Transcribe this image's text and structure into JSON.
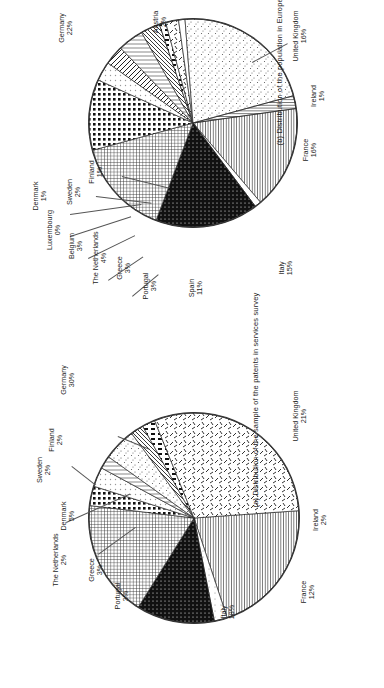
{
  "figure": {
    "panel_b_caption": "(b) Distribution of the population in Europe 1998",
    "panel_a_caption": "(a) Distribution of the sample of  the patents in services survey"
  },
  "chart_data": [
    {
      "id": "panel-b",
      "type": "pie",
      "title": "(b) Distribution of the population in Europe 1998",
      "legend_position": "callout-labels",
      "categories": [
        "United Kingdom",
        "Ireland",
        "France",
        "Italy",
        "Spain",
        "Portugal",
        "Greece",
        "The Netherlands",
        "Belgium",
        "Luxembourg",
        "Denmark",
        "Sweden",
        "Finland",
        "Germany",
        "Austria"
      ],
      "values": [
        16,
        1,
        16,
        15,
        11,
        3,
        3,
        4,
        3,
        0,
        1,
        2,
        1,
        22,
        2
      ],
      "unit": "%",
      "labels": [
        {
          "name": "United Kingdom",
          "value": "16%"
        },
        {
          "name": "Ireland",
          "value": "1%"
        },
        {
          "name": "France",
          "value": "16%"
        },
        {
          "name": "Italy",
          "value": "15%"
        },
        {
          "name": "Spain",
          "value": "11%"
        },
        {
          "name": "Portugal",
          "value": "3%"
        },
        {
          "name": "Greece",
          "value": "3%"
        },
        {
          "name": "The Netherlands",
          "value": "4%"
        },
        {
          "name": "Belgium",
          "value": "3%"
        },
        {
          "name": "Luxembourg",
          "value": "0%"
        },
        {
          "name": "Denmark",
          "value": "1%"
        },
        {
          "name": "Sweden",
          "value": "2%"
        },
        {
          "name": "Finland",
          "value": "1%"
        },
        {
          "name": "Germany",
          "value": "22%"
        },
        {
          "name": "Austria",
          "value": "2%"
        }
      ]
    },
    {
      "id": "panel-a",
      "type": "pie",
      "title": "(a) Distribution of the sample of  the patents in services survey",
      "legend_position": "callout-labels",
      "categories": [
        "United Kingdom",
        "Ireland",
        "France",
        "Italy",
        "Portugal",
        "Greece",
        "The Netherlands",
        "Denmark",
        "Sweden",
        "Finland",
        "Germany"
      ],
      "values": [
        21,
        2,
        12,
        18,
        3,
        3,
        2,
        5,
        2,
        2,
        30
      ],
      "unit": "%",
      "labels": [
        {
          "name": "United Kingdom",
          "value": "21%"
        },
        {
          "name": "Ireland",
          "value": "2%"
        },
        {
          "name": "France",
          "value": "12%"
        },
        {
          "name": "Italy",
          "value": "18%"
        },
        {
          "name": "Portugal",
          "value": "3%"
        },
        {
          "name": "Greece",
          "value": "3%"
        },
        {
          "name": "The Netherlands",
          "value": "2%"
        },
        {
          "name": "Denmark",
          "value": "5%"
        },
        {
          "name": "Sweden",
          "value": "2%"
        },
        {
          "name": "Finland",
          "value": "2%"
        },
        {
          "name": "Germany",
          "value": "30%"
        }
      ]
    }
  ]
}
